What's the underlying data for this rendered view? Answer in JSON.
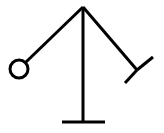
{
  "figure": {
    "width": 164,
    "height": 133,
    "background_color": "#ffffff",
    "stroke_color": "#000000",
    "stroke_width": 3,
    "apex": {
      "x": 83,
      "y": 7
    },
    "mast": {
      "name": "vertical-post",
      "x1": 83,
      "y1": 7,
      "x2": 83,
      "y2": 122
    },
    "base": {
      "name": "horizontal-base",
      "x1": 62,
      "y1": 122,
      "x2": 105,
      "y2": 122
    },
    "left_arm": {
      "name": "left-arm",
      "x1": 83,
      "y1": 7,
      "x2": 26,
      "y2": 62
    },
    "ball": {
      "name": "ball",
      "cx": 19,
      "cy": 69,
      "r": 9
    },
    "right_arm": {
      "name": "right-arm",
      "x1": 83,
      "y1": 7,
      "x2": 137,
      "y2": 70
    },
    "tip_upper": {
      "name": "arm-tip-upper",
      "x1": 137,
      "y1": 70,
      "x2": 153,
      "y2": 57
    },
    "tip_lower": {
      "name": "arm-tip-lower",
      "x1": 137,
      "y1": 70,
      "x2": 125,
      "y2": 83
    }
  }
}
